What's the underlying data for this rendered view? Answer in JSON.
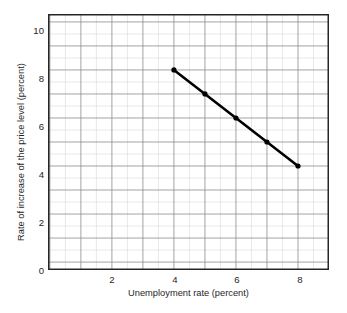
{
  "chart_data": {
    "type": "line",
    "title": "",
    "xlabel": "Unemployment rate (percent)",
    "ylabel": "Rate of increase of the price level (percent)",
    "xlim": [
      -0.06,
      9.0
    ],
    "ylim": [
      -0.33,
      10.33
    ],
    "xticks": [
      2,
      4,
      6,
      8
    ],
    "xtick_labels": [
      "2",
      "4",
      "6",
      "8"
    ],
    "yticks": [
      0,
      2,
      4,
      6,
      8,
      10
    ],
    "ytick_labels": [
      "0",
      "2",
      "4",
      "6",
      "8",
      "10"
    ],
    "grid": true,
    "grid_major_step_x": 1,
    "grid_minor_step_x": 0.5,
    "grid_major_step_y": 1,
    "grid_minor_step_y": 0.5,
    "legend": null,
    "series": [
      {
        "name": "Phillips curve",
        "color": "#000000",
        "marker": "circle",
        "x": [
          4,
          5,
          6,
          7,
          8
        ],
        "values": [
          8,
          7,
          6,
          5,
          4
        ],
        "points": [
          {
            "x": 4,
            "y": 8
          },
          {
            "x": 5,
            "y": 7
          },
          {
            "x": 6,
            "y": 6
          },
          {
            "x": 7,
            "y": 5
          },
          {
            "x": 8,
            "y": 4
          }
        ]
      }
    ]
  },
  "colors": {
    "line": "#000000",
    "marker": "#000000",
    "axis": "#262626",
    "grid_major": "#8c8c8c",
    "grid_minor": "#d9d9d9",
    "background": "#ffffff",
    "text": "#1f1f1f"
  },
  "axes": {
    "x_title": "Unemployment rate (percent)",
    "y_title": "Rate of increase of the price level (percent)"
  },
  "x_tick_labels": [
    "2",
    "4",
    "6",
    "8"
  ],
  "y_tick_labels": [
    "10",
    "8",
    "6",
    "4",
    "2",
    "0"
  ]
}
